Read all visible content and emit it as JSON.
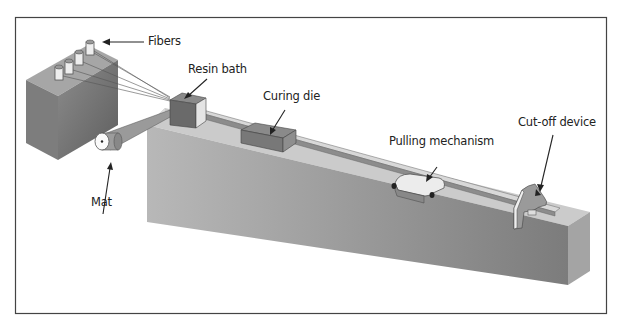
{
  "diagram": {
    "labels": {
      "fibers": "Fibers",
      "resin_bath": "Resin bath",
      "curing_die": "Curing die",
      "pulling_mechanism": "Pulling mechanism",
      "cut_off_device": "Cut-off device",
      "mat": "Mat"
    },
    "colors": {
      "frame": "#444444",
      "bed_top": "#c8c8c8",
      "bed_front": "#8a8a8a",
      "bed_side": "#b0b0b0",
      "creel_top": "#a8a8a8",
      "creel_front": "#7a7a7a",
      "creel_side": "#6a6a6a",
      "component_dark": "#6e6e6e",
      "component_light": "#e6e6e6"
    }
  }
}
